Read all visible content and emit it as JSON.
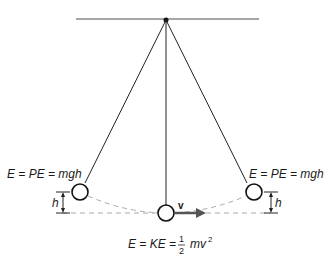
{
  "diagram": {
    "labels": {
      "left_energy": "E = PE = mgh",
      "right_energy": "E = PE = mgh",
      "bottom_energy_prefix": "E = KE = ",
      "fraction_numerator": "1",
      "fraction_denominator": "2",
      "bottom_energy_suffix": "mv",
      "exponent": "2",
      "left_height": "h",
      "right_height": "h",
      "velocity": "v"
    },
    "colors": {
      "line": "#222222",
      "ceiling": "#888888",
      "dashed": "#aaaaaa",
      "arrow": "#555555"
    }
  }
}
